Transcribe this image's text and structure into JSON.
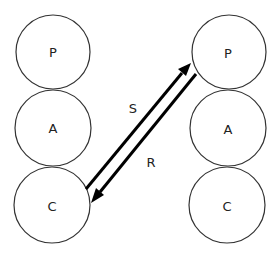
{
  "diagram": {
    "left_stack": {
      "nodes": [
        {
          "id": "left-p",
          "label": "P",
          "cx": 53,
          "cy": 52,
          "r": 37
        },
        {
          "id": "left-a",
          "label": "A",
          "cx": 53,
          "cy": 128,
          "r": 38
        },
        {
          "id": "left-c",
          "label": "C",
          "cx": 52,
          "cy": 205,
          "r": 38
        }
      ]
    },
    "right_stack": {
      "nodes": [
        {
          "id": "right-p",
          "label": "P",
          "cx": 229,
          "cy": 52,
          "r": 37
        },
        {
          "id": "right-a",
          "label": "A",
          "cx": 228,
          "cy": 128,
          "r": 38
        },
        {
          "id": "right-c",
          "label": "C",
          "cx": 227,
          "cy": 205,
          "r": 38
        }
      ]
    },
    "arrows": [
      {
        "id": "send",
        "label": "S",
        "from": "left-c",
        "to": "right-p"
      },
      {
        "id": "receive",
        "label": "R",
        "from": "right-p",
        "to": "left-c"
      }
    ],
    "colors": {
      "stroke": "#333333",
      "arrow": "#000000",
      "background": "#ffffff"
    }
  }
}
